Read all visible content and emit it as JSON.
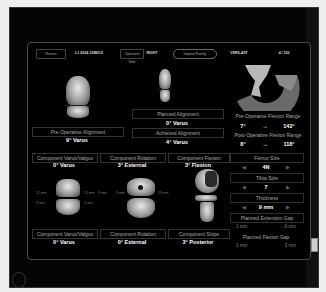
{
  "topbar": {
    "items": [
      {
        "label": "Recent",
        "style": "box"
      },
      {
        "label": "L1-0024-1098012",
        "style": "text"
      },
      {
        "label": "Operative Side",
        "style": "box"
      },
      {
        "label": "RIGHT",
        "style": "text"
      },
      {
        "label": "Implant Family",
        "style": "pill"
      },
      {
        "label": "VERILAST",
        "style": "text"
      },
      {
        "label": "4 / 100",
        "style": "text"
      }
    ]
  },
  "pre_op": {
    "label": "Pre-Operative Alignment",
    "value": "9° Varus"
  },
  "planned": {
    "label": "Planned Alignment",
    "value": "0° Varus"
  },
  "achieved": {
    "label": "Achieved Alignment",
    "value": "4° Varus"
  },
  "flexion": {
    "pre_label": "Pre-Operative Flexion Range",
    "pre_min": "7°",
    "pre_arrow": "→",
    "pre_max": "142°",
    "post_label": "Post-Operative Flexion Range",
    "post_min": "8°",
    "post_arrow": "→",
    "post_max": "118°"
  },
  "femoral_components": [
    {
      "label": "Component Varus/Valgus",
      "value": "0° Varus"
    },
    {
      "label": "Component Rotation",
      "value": "3° External"
    },
    {
      "label": "Component Flexion",
      "value": "3° Flexion"
    }
  ],
  "tibial_components": [
    {
      "label": "Component Varus/Valgus",
      "value": "0° Varus"
    },
    {
      "label": "Component Rotation",
      "value": "0° External"
    },
    {
      "label": "Component Slope",
      "value": "3° Posterior"
    }
  ],
  "measurements": {
    "left_medial_top": "11 mm",
    "left_lateral_top": "10 mm",
    "left_far_right": "9 mm",
    "left_medial_bottom": "3 mm",
    "left_lateral_bottom": "2 mm",
    "rot_left": "9 mm",
    "rot_right": "11 mm"
  },
  "sizing": {
    "femur_label": "Femur Size",
    "femur_value": "4N",
    "tibia_label": "Tibia Size",
    "tibia_value": "7",
    "thickness_label": "Thickness",
    "thickness_value": "9 mm",
    "ext_gap_label": "Planned Extension Gap",
    "ext_gap_left": "1 mm",
    "ext_gap_right": "-0 mm",
    "flex_gap_label": "Planned Flexion Gap",
    "flex_gap_left": "1 mm",
    "flex_gap_right": "3 mm",
    "arrow_left": "◀",
    "arrow_right": "▶"
  }
}
